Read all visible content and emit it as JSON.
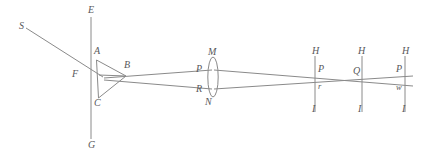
{
  "figure": {
    "type": "optics-ray-diagram",
    "background_color": "#ffffff",
    "line_color": "#8a8a8a",
    "label_color": "#58585a"
  },
  "labels": {
    "source": "S",
    "screen_top": "E",
    "screen_bottom": "G",
    "aperture": "F",
    "prism_apex_top": "A",
    "prism_vertex_right": "B",
    "prism_apex_bottom": "C",
    "lens_top": "M",
    "lens_bottom": "N",
    "lens_upper_ray": "P",
    "lens_lower_ray": "R",
    "screen1_top": "H",
    "screen1_bottom": "I",
    "screen1_upper": "P",
    "screen1_lower": "r",
    "screen2_top": "H",
    "screen2_bottom": "I",
    "screen2_cross": "Q",
    "screen3_top": "H",
    "screen3_bottom": "I",
    "screen3_upper": "P",
    "screen3_lower": "w"
  },
  "elements": {
    "incident_ray": {
      "from": "S",
      "to": "F"
    },
    "aperture_screen": {
      "top": "E",
      "bottom": "G",
      "x": 91
    },
    "prism": {
      "vertices": [
        "A",
        "B",
        "C"
      ]
    },
    "lens": {
      "top": "M",
      "bottom": "N",
      "upper_edge": "P",
      "lower_edge": "R"
    },
    "screens": [
      {
        "top": "H",
        "bottom": "I",
        "upper_mark": "P",
        "lower_mark": "r"
      },
      {
        "top": "H",
        "bottom": "I",
        "cross_mark": "Q"
      },
      {
        "top": "H",
        "bottom": "I",
        "upper_mark": "P",
        "lower_mark": "w"
      }
    ]
  },
  "label_positions": {
    "S": {
      "x": 19,
      "y": 21
    },
    "E": {
      "x": 88,
      "y": 5
    },
    "G": {
      "x": 88,
      "y": 140
    },
    "F": {
      "x": 72,
      "y": 69
    },
    "A": {
      "x": 94,
      "y": 46
    },
    "B": {
      "x": 124,
      "y": 60
    },
    "C": {
      "x": 94,
      "y": 98
    },
    "M": {
      "x": 208,
      "y": 47
    },
    "N": {
      "x": 205,
      "y": 97
    },
    "P1": {
      "x": 196,
      "y": 65
    },
    "R": {
      "x": 196,
      "y": 85
    },
    "H1": {
      "x": 312,
      "y": 47
    },
    "I1": {
      "x": 312,
      "y": 104
    },
    "P2": {
      "x": 317,
      "y": 65
    },
    "r": {
      "x": 317,
      "y": 82
    },
    "H2": {
      "x": 358,
      "y": 47
    },
    "I2": {
      "x": 358,
      "y": 104
    },
    "Q": {
      "x": 355,
      "y": 67
    },
    "H3": {
      "x": 402,
      "y": 47
    },
    "I3": {
      "x": 402,
      "y": 104
    },
    "P3": {
      "x": 397,
      "y": 65
    },
    "w": {
      "x": 397,
      "y": 83
    }
  }
}
